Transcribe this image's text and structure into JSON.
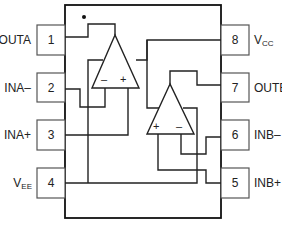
{
  "diagram": {
    "orientation_marker": "pin-1 dot",
    "pins": [
      {
        "number": "1",
        "label": "OUTA",
        "label_main": "OUTA",
        "label_sub": "",
        "side": "left"
      },
      {
        "number": "2",
        "label": "INA–",
        "label_main": "INA–",
        "label_sub": "",
        "side": "left"
      },
      {
        "number": "3",
        "label": "INA+",
        "label_main": "INA+",
        "label_sub": "",
        "side": "left"
      },
      {
        "number": "4",
        "label": "VEE",
        "label_main": "V",
        "label_sub": "EE",
        "side": "left"
      },
      {
        "number": "5",
        "label": "INB+",
        "label_main": "INB+",
        "label_sub": "",
        "side": "right"
      },
      {
        "number": "6",
        "label": "INB–",
        "label_main": "INB–",
        "label_sub": "",
        "side": "right"
      },
      {
        "number": "7",
        "label": "OUTB",
        "label_main": "OUTB",
        "label_sub": "",
        "side": "right"
      },
      {
        "number": "8",
        "label": "VCC",
        "label_main": "V",
        "label_sub": "CC",
        "side": "right"
      }
    ],
    "amplifiers": [
      {
        "name": "A",
        "inverting_sign": "–",
        "noninverting_sign": "+"
      },
      {
        "name": "B",
        "inverting_sign": "–",
        "noninverting_sign": "+"
      }
    ]
  }
}
